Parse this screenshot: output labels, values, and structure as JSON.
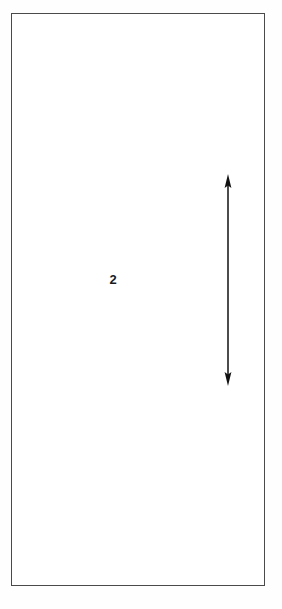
{
  "figure": {
    "background_color": "#fefefe",
    "stroke_color": "#4a4a4a",
    "ink_color": "#1a1a1a"
  },
  "outline": {
    "name": "rectangular-object-outline",
    "x": 11,
    "y": 13,
    "width": 254,
    "height": 573,
    "stroke_width": 1,
    "fill": "#ffffff"
  },
  "dimension_arrow": {
    "name": "vertical-double-headed-dimension-arrow",
    "x": 228,
    "y_top": 174,
    "y_bottom": 386,
    "length": 212,
    "line_width": 1.5,
    "head_width": 7,
    "head_length": 12,
    "color": "#111111",
    "double_headed": true
  },
  "labels": [
    {
      "name": "reference-numeral",
      "text": "2",
      "x": 112,
      "y": 281,
      "font_size": 13,
      "bold": true,
      "color": "#1a1a1a"
    }
  ]
}
